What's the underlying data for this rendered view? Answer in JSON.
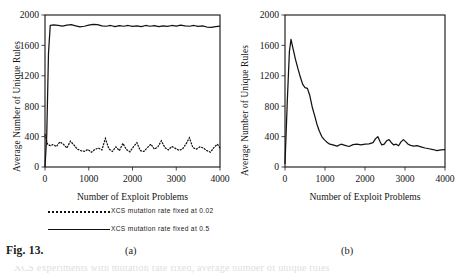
{
  "figure": {
    "label": "Fig. 13.",
    "sub_a": "(a)",
    "sub_b": "(b)",
    "clipped_footer": "XCS experiments with mutation rate fixed, average number of unique rules"
  },
  "legend": {
    "items": [
      {
        "key": "dotted",
        "label": "XCS mutation rate fixed at 0.02"
      },
      {
        "key": "solid",
        "label": "XCS mutation rate fixed at 0.5"
      }
    ]
  },
  "chart_data": [
    {
      "panel": "(a)",
      "type": "line",
      "title": "",
      "xlabel": "Number of Exploit Problems",
      "ylabel": "Average Number of Unique Rules",
      "xlim": [
        0,
        4000
      ],
      "ylim": [
        0,
        2000
      ],
      "xticks": [
        0,
        1000,
        2000,
        3000,
        4000
      ],
      "yticks": [
        0,
        400,
        800,
        1200,
        1600,
        2000
      ],
      "xticklabels": [
        "0",
        "1000",
        "2000",
        "3000",
        "4000"
      ],
      "yticklabels": [
        "0",
        "400",
        "800",
        "1200",
        "1600",
        "2000"
      ],
      "grid": "horizontal",
      "legend_position": "below",
      "series": [
        {
          "name": "XCS mutation rate fixed at 0.5",
          "style": "solid",
          "x": [
            0,
            40,
            80,
            120,
            200,
            300,
            400,
            500,
            600,
            700,
            800,
            900,
            1000,
            1100,
            1200,
            1300,
            1400,
            1500,
            1600,
            1700,
            1800,
            1900,
            2000,
            2100,
            2200,
            2300,
            2400,
            2500,
            2600,
            2700,
            2800,
            2900,
            3000,
            3100,
            3200,
            3300,
            3400,
            3500,
            3600,
            3700,
            3800,
            3900,
            4000
          ],
          "values": [
            0,
            420,
            1500,
            1865,
            1870,
            1862,
            1855,
            1868,
            1872,
            1858,
            1845,
            1852,
            1868,
            1878,
            1872,
            1858,
            1852,
            1862,
            1848,
            1860,
            1852,
            1862,
            1850,
            1858,
            1848,
            1862,
            1852,
            1860,
            1846,
            1858,
            1850,
            1862,
            1855,
            1866,
            1858,
            1852,
            1862,
            1850,
            1858,
            1842,
            1836,
            1848,
            1855
          ]
        },
        {
          "name": "XCS mutation rate fixed at 0.02",
          "style": "dotted",
          "x": [
            0,
            60,
            120,
            180,
            260,
            340,
            420,
            500,
            580,
            660,
            740,
            820,
            900,
            980,
            1060,
            1140,
            1220,
            1300,
            1380,
            1460,
            1540,
            1620,
            1700,
            1780,
            1860,
            1940,
            2020,
            2100,
            2180,
            2260,
            2340,
            2420,
            2500,
            2580,
            2660,
            2740,
            2820,
            2900,
            2980,
            3060,
            3140,
            3220,
            3300,
            3380,
            3460,
            3540,
            3620,
            3700,
            3780,
            3860,
            3940,
            4000
          ],
          "values": [
            430,
            300,
            280,
            295,
            270,
            330,
            300,
            250,
            340,
            290,
            235,
            215,
            205,
            230,
            195,
            230,
            250,
            225,
            375,
            240,
            205,
            265,
            215,
            310,
            230,
            200,
            265,
            320,
            215,
            205,
            255,
            300,
            235,
            265,
            345,
            255,
            225,
            270,
            245,
            220,
            235,
            300,
            385,
            255,
            235,
            265,
            250,
            215,
            195,
            255,
            300,
            250
          ]
        }
      ]
    },
    {
      "panel": "(b)",
      "type": "line",
      "title": "",
      "xlabel": "Number of Exploit Problems",
      "ylabel": "Average Number of Unique Rules",
      "xlim": [
        0,
        4000
      ],
      "ylim": [
        0,
        2000
      ],
      "xticks": [
        0,
        1000,
        2000,
        3000,
        4000
      ],
      "yticks": [
        0,
        400,
        800,
        1200,
        1600,
        2000
      ],
      "xticklabels": [
        "0",
        "1000",
        "2000",
        "3000",
        "4000"
      ],
      "yticklabels": [
        "0",
        "400",
        "800",
        "1200",
        "1600",
        "2000"
      ],
      "grid": "horizontal",
      "legend_position": "none",
      "series": [
        {
          "name": "XCS adaptive mutation rate",
          "style": "solid",
          "x": [
            0,
            60,
            110,
            150,
            200,
            260,
            320,
            380,
            440,
            500,
            560,
            620,
            680,
            740,
            800,
            860,
            920,
            980,
            1040,
            1120,
            1200,
            1300,
            1400,
            1500,
            1600,
            1700,
            1800,
            1900,
            2000,
            2100,
            2200,
            2260,
            2320,
            2380,
            2420,
            2480,
            2540,
            2600,
            2660,
            2720,
            2780,
            2840,
            2900,
            2960,
            3020,
            3080,
            3140,
            3220,
            3300,
            3400,
            3500,
            3600,
            3700,
            3800,
            3900,
            4000
          ],
          "values": [
            40,
            900,
            1520,
            1680,
            1560,
            1420,
            1300,
            1190,
            1090,
            1045,
            1035,
            940,
            790,
            680,
            560,
            470,
            400,
            360,
            330,
            300,
            290,
            275,
            300,
            285,
            270,
            295,
            300,
            290,
            300,
            305,
            320,
            370,
            400,
            330,
            290,
            300,
            345,
            360,
            320,
            290,
            300,
            280,
            330,
            360,
            330,
            300,
            285,
            275,
            280,
            265,
            250,
            240,
            230,
            215,
            225,
            230
          ]
        }
      ]
    }
  ]
}
